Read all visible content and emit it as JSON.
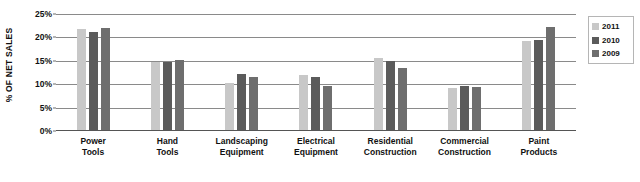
{
  "chart_data": {
    "type": "bar",
    "title": "",
    "xlabel": "",
    "ylabel": "% OF NET SALES",
    "ylim": [
      0,
      25
    ],
    "ytick_values": [
      0,
      5,
      10,
      15,
      20,
      25
    ],
    "ytick_labels": [
      "0%",
      "5%",
      "10%",
      "15%",
      "20%",
      "25%"
    ],
    "grid": true,
    "legend_position": "right",
    "categories": [
      "Power Tools",
      "Hand Tools",
      "Landscaping Equipment",
      "Electrical Equipment",
      "Residential Construction",
      "Commercial Construction",
      "Paint Products"
    ],
    "category_lines": [
      [
        "Power",
        "Tools"
      ],
      [
        "Hand",
        "Tools"
      ],
      [
        "Landscaping",
        "Equipment"
      ],
      [
        "Electrical",
        "Equipment"
      ],
      [
        "Residential",
        "Construction"
      ],
      [
        "Commercial",
        "Construction"
      ],
      [
        "Paint",
        "Products"
      ]
    ],
    "series": [
      {
        "name": "2011",
        "color": "#c8c8c8",
        "values": [
          21.5,
          14.6,
          10.1,
          11.8,
          15.3,
          9.0,
          19.0
        ]
      },
      {
        "name": "2010",
        "color": "#5b5b5b",
        "values": [
          21.0,
          14.6,
          12.0,
          11.3,
          14.7,
          9.5,
          19.3
        ]
      },
      {
        "name": "2009",
        "color": "#6e6e6e",
        "values": [
          21.9,
          14.9,
          11.3,
          9.3,
          13.3,
          9.2,
          22.0
        ]
      }
    ]
  },
  "legend": {
    "items": [
      {
        "label": "2011",
        "color": "#c8c8c8"
      },
      {
        "label": "2010",
        "color": "#5b5b5b"
      },
      {
        "label": "2009",
        "color": "#6e6e6e"
      }
    ]
  }
}
